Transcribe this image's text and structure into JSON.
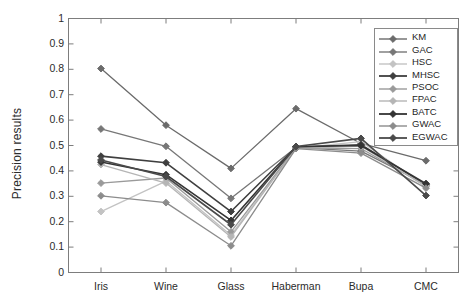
{
  "chart_data": {
    "type": "line",
    "title": "",
    "xlabel": "",
    "ylabel": "Precision results",
    "categories": [
      "Iris",
      "Wine",
      "Glass",
      "Haberman",
      "Bupa",
      "CMC"
    ],
    "ylim": [
      0,
      1
    ],
    "yticks": [
      "0",
      "0.1",
      "0.2",
      "0.3",
      "0.4",
      "0.5",
      "0.6",
      "0.7",
      "0.8",
      "0.9",
      "1"
    ],
    "ytick_values": [
      0,
      0.1,
      0.2,
      0.3,
      0.4,
      0.5,
      0.6,
      0.7,
      0.8,
      0.9,
      1
    ],
    "grid": false,
    "legend_position": "top-right",
    "marker": "diamond",
    "series": [
      {
        "name": "KM",
        "color": "#6b6b6b",
        "values": [
          0.803,
          0.58,
          0.41,
          0.645,
          0.508,
          0.44
        ]
      },
      {
        "name": "GAC",
        "color": "#777777",
        "values": [
          0.565,
          0.497,
          0.292,
          0.492,
          0.478,
          0.348
        ]
      },
      {
        "name": "HSC",
        "color": "#c3c3c3",
        "values": [
          0.24,
          0.36,
          0.147,
          0.49,
          0.515,
          0.34
        ]
      },
      {
        "name": "MHSC",
        "color": "#3f3f3f",
        "values": [
          0.458,
          0.432,
          0.24,
          0.494,
          0.503,
          0.345
        ]
      },
      {
        "name": "PSOC",
        "color": "#9a9a9a",
        "values": [
          0.352,
          0.372,
          0.16,
          0.491,
          0.488,
          0.342
        ]
      },
      {
        "name": "FPAC",
        "color": "#b5b5b5",
        "values": [
          0.425,
          0.352,
          0.14,
          0.489,
          0.498,
          0.338
        ]
      },
      {
        "name": "BATC",
        "color": "#343434",
        "values": [
          0.435,
          0.385,
          0.205,
          0.495,
          0.5,
          0.35
        ]
      },
      {
        "name": "GWAC",
        "color": "#8c8c8c",
        "values": [
          0.302,
          0.275,
          0.105,
          0.488,
          0.47,
          0.332
        ]
      },
      {
        "name": "EGWAC",
        "color": "#4a4a4a",
        "values": [
          0.443,
          0.378,
          0.188,
          0.496,
          0.528,
          0.303
        ]
      }
    ]
  },
  "axes": {
    "y_label": "Precision results"
  }
}
